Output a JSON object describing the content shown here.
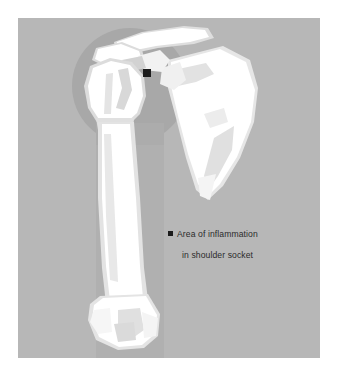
{
  "figure": {
    "name": "shoulder-inflammation-illustration",
    "panel_background_color": "#b7b7b7",
    "page_background_color": "#ffffff",
    "bone_color": "#ffffff",
    "bone_shade_color": "#e8e8e8",
    "bone_midtone_color": "#d5d5d5",
    "highlight_circle_color": "#a6a6a6",
    "highlight_column_color": "#afafaf",
    "marker_color": "#1c1c1c"
  },
  "legend": {
    "swatch_name": "black-square-marker",
    "line_1": "Area of inflammation",
    "line_2": "in shoulder socket"
  },
  "marker": {
    "name": "inflammation-site-marker",
    "x": 129,
    "y": 55
  },
  "anatomy": {
    "parts": [
      {
        "name": "clavicle",
        "label": "Clavicle"
      },
      {
        "name": "acromion",
        "label": "Acromion"
      },
      {
        "name": "scapula",
        "label": "Scapula"
      },
      {
        "name": "humerus-head",
        "label": "Humeral head"
      },
      {
        "name": "humerus-shaft",
        "label": "Humeral shaft"
      },
      {
        "name": "humerus-distal",
        "label": "Distal humerus"
      }
    ]
  }
}
